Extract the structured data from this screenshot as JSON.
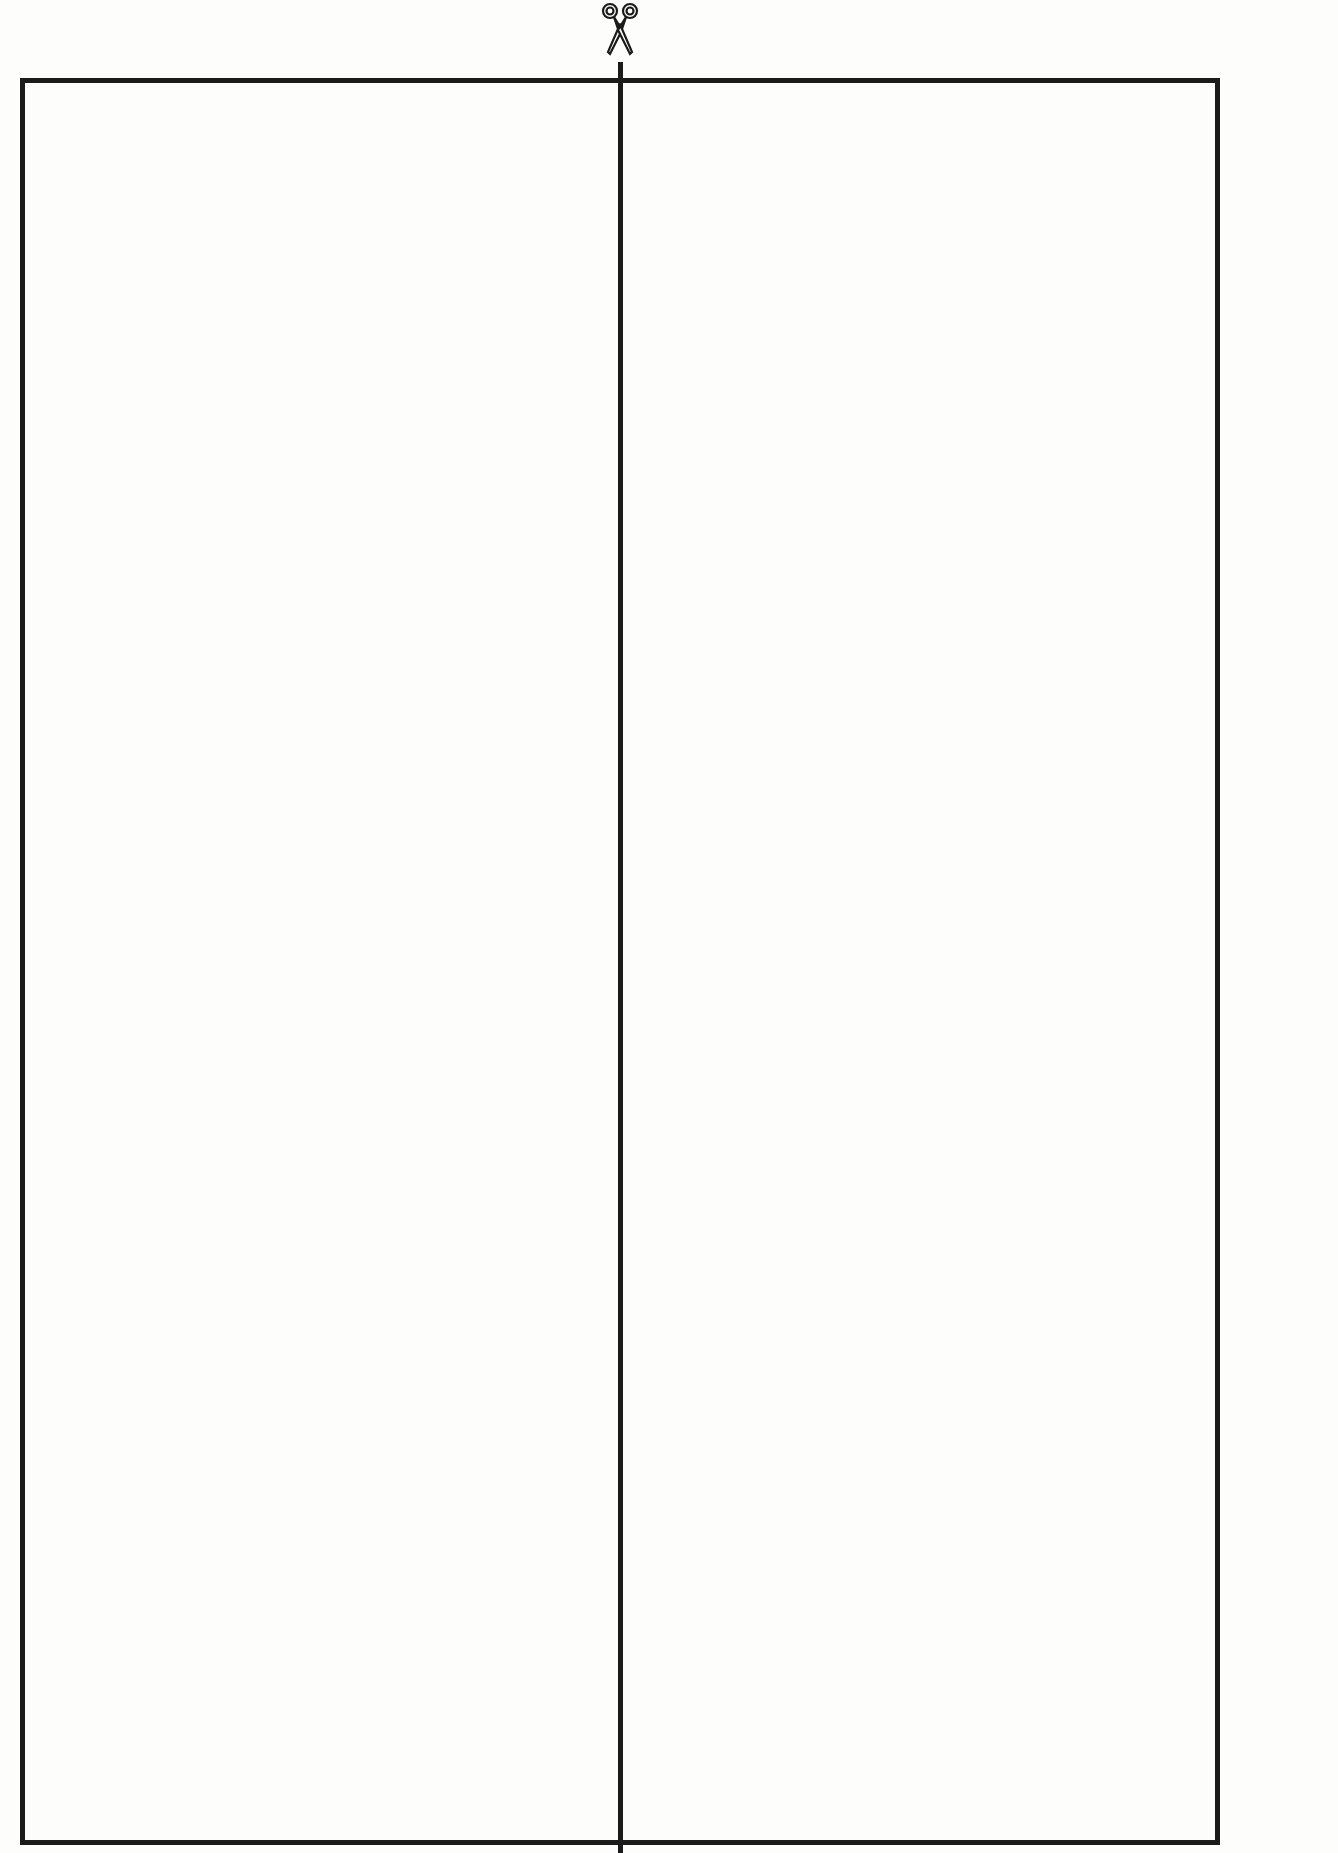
{
  "icons": {
    "scissors": "scissors-icon"
  },
  "grid": {
    "columns": 10,
    "rows": 20,
    "line_color": "#1b1b1b",
    "dot_color": "#1a1a1a",
    "cut_after_rows": [
      4,
      8,
      12,
      16
    ],
    "center_cut_after_column": 5,
    "cards": [
      {
        "count": 7,
        "rows": [
          [
            1,
            1,
            1,
            0,
            0,
            1,
            1,
            1,
            1,
            0
          ],
          [
            0,
            0,
            0,
            0,
            0,
            0,
            0,
            0,
            0,
            0
          ],
          [
            0,
            0,
            0,
            0,
            0,
            0,
            0,
            0,
            0,
            0
          ],
          [
            0,
            0,
            0,
            0,
            0,
            0,
            0,
            0,
            0,
            0
          ]
        ]
      },
      {
        "count": 15,
        "rows": [
          [
            1,
            1,
            1,
            1,
            1,
            1,
            1,
            1,
            1,
            1
          ],
          [
            1,
            1,
            0,
            0,
            0,
            1,
            1,
            1,
            0,
            0
          ],
          [
            0,
            0,
            0,
            0,
            0,
            0,
            0,
            0,
            0,
            0
          ],
          [
            0,
            0,
            0,
            0,
            0,
            0,
            0,
            0,
            0,
            0
          ]
        ]
      },
      {
        "count": 23,
        "rows": [
          [
            1,
            1,
            1,
            1,
            1,
            1,
            1,
            1,
            1,
            1
          ],
          [
            1,
            1,
            1,
            1,
            1,
            1,
            1,
            1,
            1,
            1
          ],
          [
            1,
            0,
            0,
            0,
            0,
            1,
            1,
            0,
            0,
            0
          ],
          [
            0,
            0,
            0,
            0,
            0,
            0,
            0,
            0,
            0,
            0
          ]
        ]
      },
      {
        "count": 31,
        "rows": [
          [
            1,
            1,
            1,
            1,
            1,
            1,
            1,
            1,
            1,
            1
          ],
          [
            1,
            1,
            1,
            1,
            1,
            1,
            1,
            1,
            1,
            1
          ],
          [
            1,
            1,
            1,
            1,
            1,
            1,
            1,
            1,
            1,
            1
          ],
          [
            0,
            0,
            0,
            0,
            0,
            1,
            0,
            0,
            0,
            0
          ]
        ]
      },
      {
        "count": 39,
        "rows": [
          [
            1,
            1,
            1,
            1,
            1,
            1,
            1,
            1,
            1,
            1
          ],
          [
            1,
            1,
            1,
            1,
            1,
            1,
            1,
            1,
            1,
            1
          ],
          [
            1,
            1,
            1,
            1,
            1,
            1,
            1,
            1,
            1,
            1
          ],
          [
            1,
            1,
            1,
            1,
            0,
            1,
            1,
            1,
            1,
            1
          ]
        ]
      }
    ]
  }
}
